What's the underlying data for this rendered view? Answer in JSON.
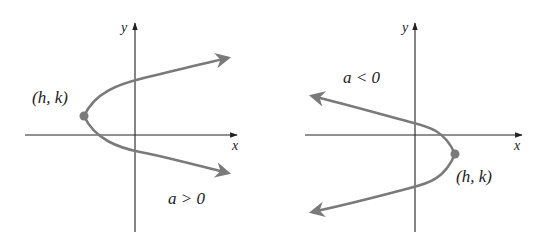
{
  "colors": {
    "curve": "#7a7a7a",
    "axis": "#222222",
    "vertex": "#7a7a7a"
  },
  "left_graph": {
    "x_label": "x",
    "y_label": "y",
    "vertex_label": "(h, k)",
    "condition_label": "a > 0"
  },
  "right_graph": {
    "x_label": "x",
    "y_label": "y",
    "vertex_label": "(h, k)",
    "condition_label": "a < 0"
  }
}
